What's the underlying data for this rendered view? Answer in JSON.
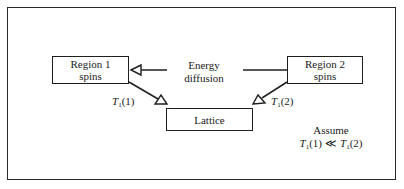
{
  "diagram": {
    "nodes": {
      "region1": {
        "line1": "Region 1",
        "line2": "spins"
      },
      "region2": {
        "line1": "Region 2",
        "line2": "spins"
      },
      "lattice": {
        "label": "Lattice"
      }
    },
    "energy_label": {
      "line1": "Energy",
      "line2": "diffusion"
    },
    "relaxation_labels": {
      "t1": {
        "symbol": "T",
        "subscript": "1",
        "arg": "(1)"
      },
      "t2": {
        "symbol": "T",
        "subscript": "1",
        "arg": "(2)"
      }
    },
    "assumption": {
      "title": "Assume",
      "lhs_symbol": "T",
      "lhs_subscript": "1",
      "lhs_arg": "(1)",
      "operator": "≪",
      "rhs_symbol": "T",
      "rhs_subscript": "1",
      "rhs_arg": "(2)"
    },
    "edges": [
      {
        "from": "energy-diffusion",
        "to": "region1",
        "arrowhead": "hollow-triangle"
      },
      {
        "from": "energy-diffusion",
        "to": "region2",
        "arrowhead": "none"
      },
      {
        "from": "region1",
        "to": "lattice",
        "label": "T1(1)",
        "arrowhead": "hollow-triangle"
      },
      {
        "from": "region2",
        "to": "lattice",
        "label": "T1(2)",
        "arrowhead": "hollow-triangle"
      }
    ],
    "colors": {
      "stroke": "#1f1f1f",
      "background": "#ffffff"
    }
  }
}
